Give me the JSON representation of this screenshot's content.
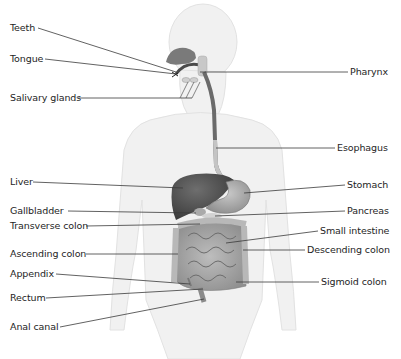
{
  "diagram": {
    "left_labels": [
      {
        "id": "teeth",
        "text": "Teeth",
        "x": 10,
        "y": 22,
        "line": [
          38,
          28,
          176,
          72
        ]
      },
      {
        "id": "tongue",
        "text": "Tongue",
        "x": 10,
        "y": 53,
        "line": [
          45,
          59,
          176,
          74
        ]
      },
      {
        "id": "salivary-glands",
        "text": "Salivary glands",
        "x": 10,
        "y": 92,
        "line": [
          78,
          98,
          192,
          98
        ]
      },
      {
        "id": "liver",
        "text": "Liver",
        "x": 10,
        "y": 176,
        "line": [
          33,
          182,
          183,
          188
        ]
      },
      {
        "id": "gallbladder",
        "text": "Gallbladder",
        "x": 10,
        "y": 205,
        "line": [
          68,
          211,
          196,
          213
        ]
      },
      {
        "id": "transverse-colon",
        "text": "Transverse colon",
        "x": 10,
        "y": 220,
        "line": [
          86,
          226,
          200,
          224
        ]
      },
      {
        "id": "ascending-colon",
        "text": "Ascending colon",
        "x": 10,
        "y": 248,
        "line": [
          86,
          254,
          178,
          254
        ]
      },
      {
        "id": "appendix",
        "text": "Appendix",
        "x": 10,
        "y": 268,
        "line": [
          56,
          274,
          190,
          284
        ]
      },
      {
        "id": "rectum",
        "text": "Rectum",
        "x": 10,
        "y": 292,
        "line": [
          46,
          298,
          203,
          289
        ]
      },
      {
        "id": "anal-canal",
        "text": "Anal canal",
        "x": 10,
        "y": 321,
        "line": [
          60,
          327,
          204,
          299
        ]
      }
    ],
    "right_labels": [
      {
        "id": "pharynx",
        "text": "Pharynx",
        "x": 350,
        "y": 66,
        "line": [
          200,
          72,
          348,
          72
        ]
      },
      {
        "id": "esophagus",
        "text": "Esophagus",
        "x": 337,
        "y": 142,
        "line": [
          216,
          148,
          335,
          148
        ]
      },
      {
        "id": "stomach",
        "text": "Stomach",
        "x": 347,
        "y": 179,
        "line": [
          244,
          193,
          345,
          185
        ]
      },
      {
        "id": "pancreas",
        "text": "Pancreas",
        "x": 347,
        "y": 205,
        "line": [
          215,
          216,
          345,
          211
        ]
      },
      {
        "id": "small-intestine",
        "text": "Small intestine",
        "x": 320,
        "y": 225,
        "line": [
          226,
          243,
          318,
          231
        ]
      },
      {
        "id": "descending-colon",
        "text": "Descending colon",
        "x": 307,
        "y": 244,
        "line": [
          243,
          250,
          305,
          250
        ]
      },
      {
        "id": "sigmoid-colon",
        "text": "Sigmoid colon",
        "x": 321,
        "y": 276,
        "line": [
          236,
          282,
          319,
          282
        ]
      }
    ]
  }
}
